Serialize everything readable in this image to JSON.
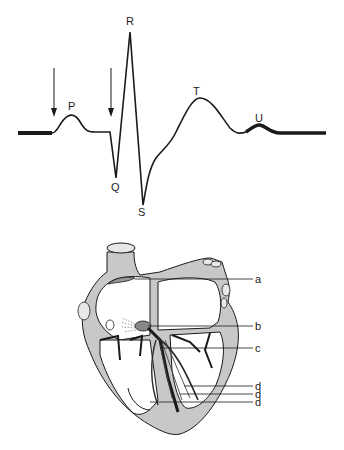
{
  "ecg": {
    "waves": {
      "P": "P",
      "Q": "Q",
      "R": "R",
      "S": "S",
      "T": "T",
      "U": "U"
    },
    "arrows": [
      "arrow-before-P",
      "arrow-before-QRS"
    ]
  },
  "heart": {
    "labels": {
      "a": "a",
      "b": "b",
      "c": "c",
      "d1": "d",
      "d2": "d",
      "d3": "d"
    }
  },
  "colors": {
    "line": "#1a1a1a",
    "wall": "#c8c8c8",
    "conduction": "#2a2a2a"
  }
}
